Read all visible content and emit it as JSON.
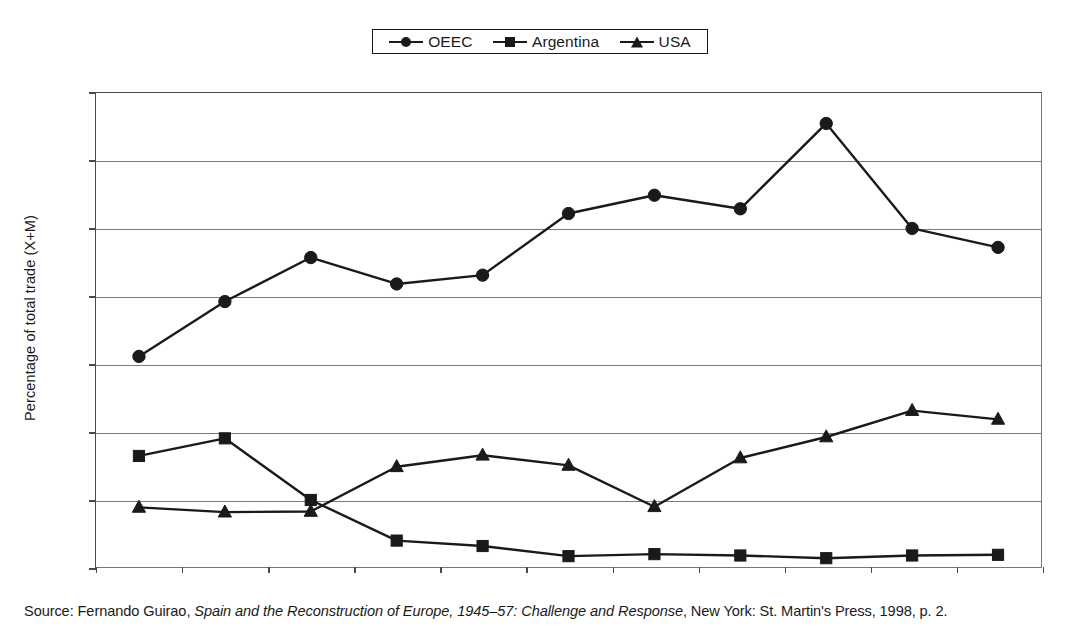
{
  "legend": {
    "position": "top-center",
    "entries": [
      {
        "label": "OEEC",
        "marker": "circle-marker-icon"
      },
      {
        "label": "Argentina",
        "marker": "square-marker-icon"
      },
      {
        "label": "USA",
        "marker": "triangle-marker-icon"
      }
    ]
  },
  "axes": {
    "ylabel": "Percentage of total trade (X+M)",
    "xlabel": "",
    "yticks": [
      "0",
      "10",
      "20",
      "30",
      "40",
      "50",
      "60",
      "70"
    ],
    "xticks": [
      "1947",
      "1948",
      "1949",
      "1950",
      "1951",
      "1952",
      "1953",
      "1954",
      "1955",
      "1956",
      "1957"
    ]
  },
  "source": {
    "prefix": "Source: Fernando Guirao, ",
    "title_italic": "Spain and the Reconstruction of Europe, 1945–57: Challenge and Response",
    "suffix": ", New York: St. Martin's Press, 1998, p. 2."
  },
  "colors": {
    "ink": "#1a1a1a",
    "grid": "#7a7a7a",
    "frame": "#4a4a4a",
    "background": "#ffffff"
  },
  "chart_data": {
    "type": "line",
    "title": "",
    "subtitle": "",
    "xlabel": "",
    "ylabel": "Percentage of total trade (X+M)",
    "categories": [
      "1947",
      "1948",
      "1949",
      "1950",
      "1951",
      "1952",
      "1953",
      "1954",
      "1955",
      "1956",
      "1957"
    ],
    "x": [
      1947,
      1948,
      1949,
      1950,
      1951,
      1952,
      1953,
      1954,
      1955,
      1956,
      1957
    ],
    "ylim": [
      0,
      70
    ],
    "ytick_step": 10,
    "grid": "horizontal",
    "legend_position": "top-center",
    "series": [
      {
        "name": "OEEC",
        "marker": "circle",
        "values": [
          31.1,
          39.2,
          45.7,
          41.8,
          43.1,
          52.2,
          54.9,
          52.9,
          65.5,
          50.0,
          47.2
        ]
      },
      {
        "name": "Argentina",
        "marker": "square",
        "values": [
          16.4,
          19.0,
          9.9,
          3.9,
          3.1,
          1.6,
          1.9,
          1.7,
          1.3,
          1.7,
          1.8
        ]
      },
      {
        "name": "USA",
        "marker": "triangle",
        "values": [
          8.8,
          8.1,
          8.2,
          14.8,
          16.5,
          15.0,
          8.9,
          16.1,
          19.2,
          23.1,
          21.8
        ]
      }
    ]
  }
}
